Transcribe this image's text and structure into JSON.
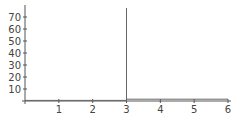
{
  "chart_data": {
    "type": "line",
    "title": "",
    "xlabel": "",
    "ylabel": "",
    "xlim": [
      0,
      6
    ],
    "ylim": [
      0,
      78
    ],
    "grid": false,
    "legend": null,
    "x_ticks": [
      1,
      2,
      3,
      4,
      5,
      6
    ],
    "y_ticks": [
      10,
      20,
      30,
      40,
      50,
      60,
      70
    ],
    "series": [
      {
        "name": "f(x)",
        "points": [
          [
            0,
            0.5
          ],
          [
            2.99,
            0.5
          ],
          [
            3,
            0.5
          ],
          [
            3,
            77.5
          ],
          [
            3,
            1.5
          ],
          [
            6,
            1.5
          ]
        ]
      }
    ],
    "annotations": []
  },
  "colors": {
    "axis": "#555555",
    "line": "#666666",
    "labels": "#444444"
  }
}
